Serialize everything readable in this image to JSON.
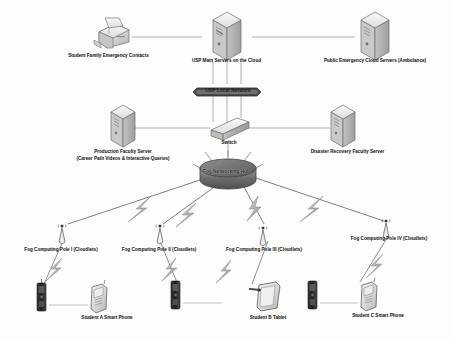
{
  "diagram": {
    "colors": {
      "line": "#8d8d8d",
      "bolt": "#b9b9b9",
      "bolt_stroke": "#6f6f6f",
      "device_light": "#d9d9d9",
      "device_dark": "#2b2b2b",
      "text": "#2b2b2b"
    },
    "nodes": {
      "fax": {
        "label": "Student Family Emergency Contacts",
        "icon": "fax-printer-icon"
      },
      "main_server": {
        "label": "USP Main Servers on the Cloud",
        "icon": "server-tower-icon"
      },
      "public_server": {
        "label": "Public Emergency Cloud Servers (Ambulance)",
        "icon": "server-tower-icon"
      },
      "local_network": {
        "label": "USP Local Network",
        "icon": "network-bus-icon"
      },
      "production_server": {
        "label": "Production Faculty Server",
        "label_line2": "(Career Path Videos & Interactive Queries)",
        "icon": "server-tower-icon"
      },
      "switch": {
        "label": "Switch",
        "icon": "switch-icon"
      },
      "disaster_server": {
        "label": "Disaster Recovery Faculty Server",
        "icon": "server-tower-icon"
      },
      "fog_hub": {
        "label": "Fog Networking Hub",
        "icon": "hub-cylinder-icon"
      }
    },
    "fog_poles": [
      {
        "label": "Fog Computing Pole I (Cloudlets)",
        "icon": "antenna-tower-icon"
      },
      {
        "label": "Fog Computing Pole II (Cloudlets)",
        "icon": "antenna-tower-icon"
      },
      {
        "label": "Fog Computing Pole III (Cloudlets)",
        "icon": "antenna-tower-icon"
      },
      {
        "label": "Fog Computing Pole IV (Cloudlets)",
        "icon": "antenna-tower-icon"
      }
    ],
    "devices": [
      {
        "label": "Student A Smart Phone",
        "icon": "smartphone-icon"
      },
      {
        "label": "Student B Tablet",
        "icon": "tablet-icon"
      },
      {
        "label": "Student C Smart Phone",
        "icon": "smartphone-icon"
      }
    ]
  }
}
